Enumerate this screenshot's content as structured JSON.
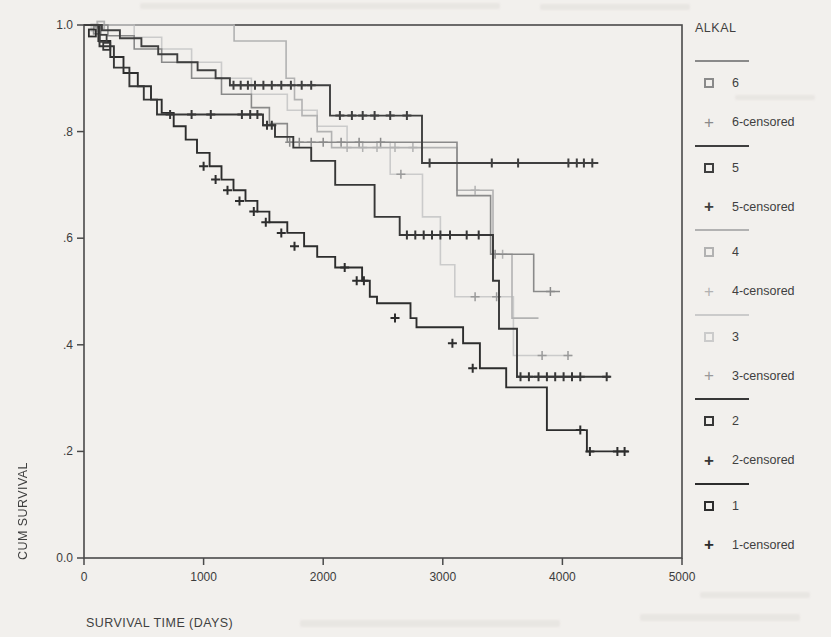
{
  "figure": {
    "background": "#f2f0ed",
    "text_color": "#3f3f3f",
    "frame_color": "#4a4a4a"
  },
  "chart_data": {
    "type": "line",
    "style": "kaplan-meier-step",
    "title": "",
    "xlabel": "SURVIVAL TIME (DAYS)",
    "ylabel": "CUM SURVIVAL",
    "xlim": [
      0,
      5000
    ],
    "ylim": [
      0.0,
      1.0
    ],
    "grid": false,
    "legend_position": "right",
    "legend_title": "ALKAL",
    "xticks": {
      "values": [
        0,
        1000,
        2000,
        3000,
        4000,
        5000
      ],
      "labels": [
        "0",
        "1000",
        "2000",
        "3000",
        "4000",
        "5000"
      ]
    },
    "yticks": {
      "values": [
        0.0,
        0.2,
        0.4,
        0.6,
        0.8,
        1.0
      ],
      "labels": [
        "0.0",
        ".2",
        ".4",
        ".6",
        ".8",
        "1.0"
      ]
    },
    "draw_order": [
      3,
      2,
      0,
      5,
      4,
      1
    ],
    "series": [
      {
        "name": "6",
        "censored_label": "6-censored",
        "color": "#8a8a8a",
        "bold": false,
        "marker": [
          110,
          0.99
        ],
        "steps": [
          [
            0,
            1.0
          ],
          [
            200,
            0.98
          ],
          [
            420,
            0.955
          ],
          [
            650,
            0.93
          ],
          [
            900,
            0.9
          ],
          [
            1150,
            0.87
          ],
          [
            1400,
            0.845
          ],
          [
            1550,
            0.815
          ],
          [
            1700,
            0.78
          ],
          [
            3119,
            0.68
          ],
          [
            3400,
            0.57
          ],
          [
            3760,
            0.5
          ]
        ],
        "end": 3980,
        "censors": [
          [
            1720,
            0.78
          ],
          [
            1800,
            0.78
          ],
          [
            1900,
            0.78
          ],
          [
            2000,
            0.78
          ],
          [
            2150,
            0.78
          ],
          [
            2300,
            0.78
          ],
          [
            2480,
            0.78
          ],
          [
            3437,
            0.57
          ],
          [
            3900,
            0.5
          ]
        ]
      },
      {
        "name": "5",
        "censored_label": "5-censored",
        "color": "#3f3f3f",
        "bold": true,
        "marker": [
          160,
          0.975
        ],
        "steps": [
          [
            0,
            1.0
          ],
          [
            150,
            0.99
          ],
          [
            300,
            0.975
          ],
          [
            480,
            0.96
          ],
          [
            620,
            0.945
          ],
          [
            780,
            0.93
          ],
          [
            950,
            0.915
          ],
          [
            1100,
            0.9
          ],
          [
            1220,
            0.887
          ],
          [
            2057,
            0.83
          ],
          [
            2826,
            0.741
          ]
        ],
        "end": 4300,
        "censors": [
          [
            1250,
            0.887
          ],
          [
            1310,
            0.887
          ],
          [
            1370,
            0.887
          ],
          [
            1430,
            0.887
          ],
          [
            1500,
            0.887
          ],
          [
            1570,
            0.887
          ],
          [
            1650,
            0.887
          ],
          [
            1730,
            0.887
          ],
          [
            1820,
            0.887
          ],
          [
            1900,
            0.887
          ],
          [
            2140,
            0.83
          ],
          [
            2240,
            0.83
          ],
          [
            2330,
            0.83
          ],
          [
            2430,
            0.83
          ],
          [
            2560,
            0.83
          ],
          [
            2700,
            0.83
          ],
          [
            2890,
            0.741
          ],
          [
            3410,
            0.741
          ],
          [
            3630,
            0.741
          ],
          [
            4050,
            0.741
          ],
          [
            4120,
            0.741
          ],
          [
            4180,
            0.741
          ],
          [
            4250,
            0.741
          ]
        ]
      },
      {
        "name": "4",
        "censored_label": "4-censored",
        "color": "#b2b2b2",
        "bold": false,
        "marker": [
          140,
          1.0
        ],
        "steps": [
          [
            0,
            1.0
          ],
          [
            1255,
            0.97
          ],
          [
            1690,
            0.9
          ],
          [
            1760,
            0.86
          ],
          [
            1823,
            0.83
          ],
          [
            1950,
            0.8
          ],
          [
            2070,
            0.77
          ],
          [
            3119,
            0.69
          ],
          [
            3420,
            0.57
          ],
          [
            3579,
            0.45
          ]
        ],
        "end": 3800,
        "censors": [
          [
            2200,
            0.77
          ],
          [
            2330,
            0.77
          ],
          [
            2450,
            0.77
          ],
          [
            2600,
            0.77
          ],
          [
            2750,
            0.77
          ],
          [
            3270,
            0.69
          ],
          [
            3500,
            0.57
          ]
        ]
      },
      {
        "name": "3",
        "censored_label": "3-censored",
        "color": "#cbcbcb",
        "bold": false,
        "censor_color": "#9a9a9a",
        "marker": [
          90,
          0.995
        ],
        "steps": [
          [
            0,
            1.0
          ],
          [
            420,
            0.977
          ],
          [
            650,
            0.955
          ],
          [
            900,
            0.93
          ],
          [
            1150,
            0.9
          ],
          [
            1400,
            0.87
          ],
          [
            1700,
            0.84
          ],
          [
            1950,
            0.81
          ],
          [
            2200,
            0.78
          ],
          [
            2560,
            0.72
          ],
          [
            2830,
            0.64
          ],
          [
            2980,
            0.55
          ],
          [
            3100,
            0.49
          ],
          [
            3590,
            0.38
          ]
        ],
        "end": 4080,
        "censors": [
          [
            2650,
            0.72
          ],
          [
            3270,
            0.49
          ],
          [
            3450,
            0.49
          ],
          [
            3830,
            0.38
          ],
          [
            4047,
            0.38
          ]
        ]
      },
      {
        "name": "2",
        "censored_label": "2-censored",
        "color": "#373737",
        "bold": true,
        "marker": [
          190,
          0.96
        ],
        "steps": [
          [
            0,
            1.0
          ],
          [
            130,
            0.96
          ],
          [
            250,
            0.92
          ],
          [
            380,
            0.885
          ],
          [
            500,
            0.86
          ],
          [
            610,
            0.832
          ],
          [
            1497,
            0.812
          ],
          [
            1597,
            0.79
          ],
          [
            1750,
            0.77
          ],
          [
            1900,
            0.745
          ],
          [
            2100,
            0.7
          ],
          [
            2430,
            0.64
          ],
          [
            2640,
            0.606
          ],
          [
            3420,
            0.52
          ],
          [
            3470,
            0.43
          ],
          [
            3620,
            0.34
          ]
        ],
        "end": 4400,
        "censors": [
          [
            720,
            0.832
          ],
          [
            900,
            0.832
          ],
          [
            1060,
            0.832
          ],
          [
            1320,
            0.832
          ],
          [
            1390,
            0.832
          ],
          [
            1450,
            0.832
          ],
          [
            1530,
            0.812
          ],
          [
            1570,
            0.812
          ],
          [
            2700,
            0.606
          ],
          [
            2770,
            0.606
          ],
          [
            2840,
            0.606
          ],
          [
            2910,
            0.606
          ],
          [
            2980,
            0.606
          ],
          [
            3060,
            0.606
          ],
          [
            3200,
            0.606
          ],
          [
            3300,
            0.606
          ],
          [
            3650,
            0.34
          ],
          [
            3720,
            0.34
          ],
          [
            3800,
            0.34
          ],
          [
            3870,
            0.34
          ],
          [
            3940,
            0.34
          ],
          [
            4010,
            0.34
          ],
          [
            4080,
            0.34
          ],
          [
            4150,
            0.34
          ],
          [
            4370,
            0.34
          ]
        ]
      },
      {
        "name": "1",
        "censored_label": "1-censored",
        "color": "#2d2d2d",
        "bold": true,
        "marker": [
          70,
          0.985
        ],
        "steps": [
          [
            0,
            1.0
          ],
          [
            120,
            0.97
          ],
          [
            220,
            0.94
          ],
          [
            330,
            0.91
          ],
          [
            450,
            0.885
          ],
          [
            560,
            0.86
          ],
          [
            650,
            0.835
          ],
          [
            750,
            0.81
          ],
          [
            850,
            0.785
          ],
          [
            945,
            0.76
          ],
          [
            1050,
            0.735
          ],
          [
            1150,
            0.71
          ],
          [
            1250,
            0.69
          ],
          [
            1350,
            0.67
          ],
          [
            1450,
            0.65
          ],
          [
            1550,
            0.63
          ],
          [
            1700,
            0.61
          ],
          [
            1840,
            0.585
          ],
          [
            1950,
            0.565
          ],
          [
            2100,
            0.545
          ],
          [
            2325,
            0.52
          ],
          [
            2390,
            0.49
          ],
          [
            2450,
            0.478
          ],
          [
            2730,
            0.45
          ],
          [
            2780,
            0.433
          ],
          [
            3170,
            0.403
          ],
          [
            3310,
            0.356
          ],
          [
            3530,
            0.32
          ],
          [
            3870,
            0.24
          ],
          [
            4205,
            0.2
          ]
        ],
        "end": 4550,
        "censors": [
          [
            1000,
            0.735
          ],
          [
            1100,
            0.71
          ],
          [
            1200,
            0.69
          ],
          [
            1300,
            0.67
          ],
          [
            1420,
            0.65
          ],
          [
            1520,
            0.63
          ],
          [
            1650,
            0.61
          ],
          [
            1760,
            0.585
          ],
          [
            2180,
            0.545
          ],
          [
            2280,
            0.52
          ],
          [
            2340,
            0.52
          ],
          [
            2600,
            0.45
          ],
          [
            3080,
            0.403
          ],
          [
            3250,
            0.356
          ],
          [
            4150,
            0.24
          ],
          [
            4230,
            0.2
          ],
          [
            4460,
            0.2
          ],
          [
            4520,
            0.2
          ]
        ]
      }
    ]
  }
}
